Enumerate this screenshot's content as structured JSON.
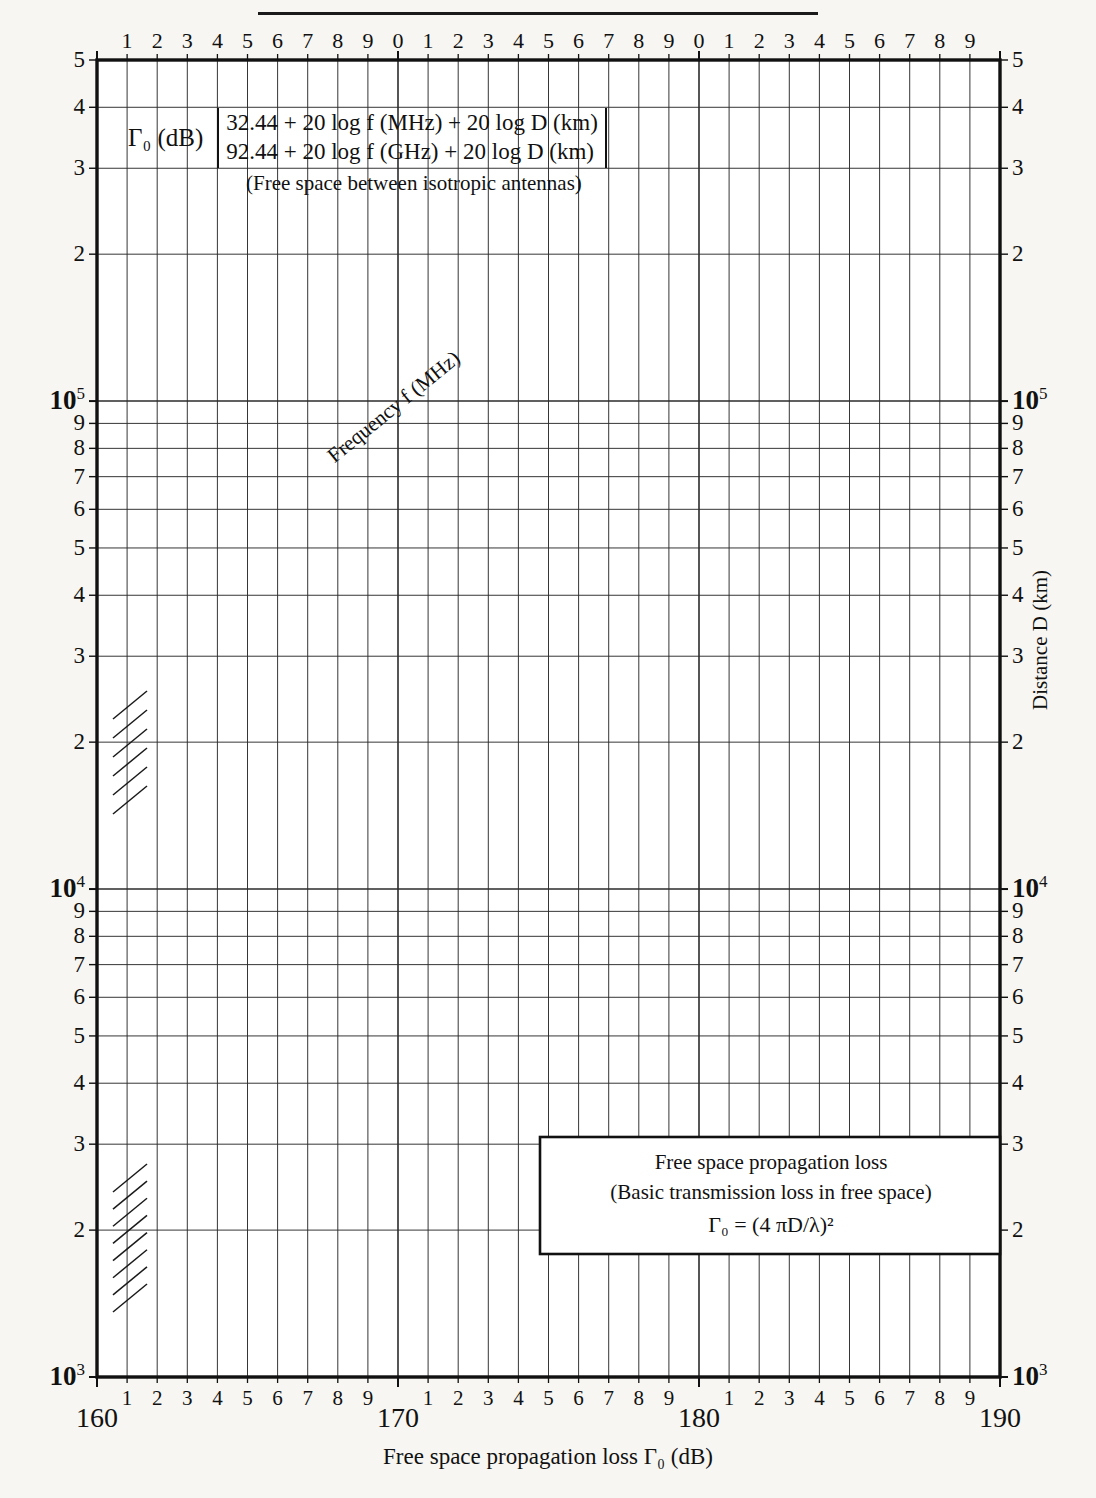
{
  "title_rule": true,
  "formula": {
    "gamma_label": "Γ₀ (dB)",
    "line1": "32.44 + 20 log f (MHz) + 20 log D (km)",
    "line2": "92.44 + 20 log f (GHz) + 20 log D (km)",
    "note": "(Free space between isotropic antennas)"
  },
  "legend": {
    "line1": "Free space propagation loss",
    "line2": "(Basic transmission loss in free space)",
    "line3": "Γ₀ = (4 πD/λ)²"
  },
  "axes": {
    "x_title": "Free space propagation loss Γ₀ (dB)",
    "y_title": "Distance D (km)",
    "x_major_labels": [
      "160",
      "170",
      "180",
      "190"
    ],
    "x_minor_labels": [
      "1",
      "2",
      "3",
      "4",
      "5",
      "6",
      "7",
      "8",
      "9"
    ],
    "x_top_labels": [
      "1",
      "2",
      "3",
      "4",
      "5",
      "6",
      "7",
      "8",
      "9",
      "0",
      "1",
      "2",
      "3",
      "4",
      "5",
      "6",
      "7",
      "8",
      "9",
      "0",
      "1",
      "2",
      "3",
      "4",
      "5",
      "6",
      "7",
      "8",
      "9"
    ],
    "y_labels_left": [
      "5",
      "4",
      "3",
      "2",
      "10⁵",
      "9",
      "8",
      "7",
      "6",
      "5",
      "4",
      "3",
      "2",
      "10⁴",
      "9",
      "8",
      "7",
      "6",
      "5",
      "4",
      "3",
      "2",
      "10³"
    ],
    "y_labels_right": [
      "5",
      "4",
      "3",
      "2",
      "10⁵",
      "9",
      "8",
      "7",
      "6",
      "5",
      "4",
      "3",
      "2",
      "10⁴",
      "9",
      "8",
      "7",
      "6",
      "5",
      "4",
      "3",
      "2",
      "10³"
    ]
  },
  "series_label": "Frequency f (MHz)",
  "chart_data": {
    "type": "line",
    "xlabel": "Free space propagation loss Γ₀ (dB)",
    "ylabel": "Distance D (km)",
    "xlim": [
      160,
      190
    ],
    "ylim": [
      1000,
      500000
    ],
    "xscale": "linear",
    "yscale": "log",
    "grid": true,
    "legend": "in-plot line labels",
    "relation": "Γ₀ = 32.44 + 20 log f(MHz) + 20 log D(km)",
    "x_ticks_major": [
      160,
      170,
      180,
      190
    ],
    "x_ticks_minor_step": 1,
    "y_decades": [
      1000,
      10000,
      100000,
      500000
    ],
    "series": [
      {
        "name": "100",
        "frequency_mhz": 100,
        "bold": true,
        "points": [
          [
            160,
            1.5136
          ],
          [
            190,
            47.863
          ]
        ]
      },
      {
        "name": "200",
        "frequency_mhz": 200,
        "bold": false,
        "points": [
          [
            160,
            0.7568
          ],
          [
            190,
            23.931
          ]
        ]
      },
      {
        "name": "300",
        "frequency_mhz": 300,
        "bold": false,
        "points": [
          [
            160,
            0.5045
          ],
          [
            190,
            15.954
          ]
        ]
      },
      {
        "name": "400",
        "frequency_mhz": 400,
        "bold": false,
        "points": [
          [
            160,
            0.3784
          ],
          [
            190,
            11.966
          ]
        ]
      },
      {
        "name": "500",
        "frequency_mhz": 500,
        "bold": false,
        "points": [
          [
            160,
            0.3027
          ],
          [
            190,
            9.5726
          ]
        ]
      },
      {
        "name": "600",
        "frequency_mhz": 600,
        "bold": false,
        "points": [
          [
            160,
            0.2523
          ],
          [
            190,
            7.9772
          ]
        ]
      },
      {
        "name": "700",
        "frequency_mhz": 700,
        "bold": false,
        "points": [
          [
            160,
            0.2162
          ],
          [
            190,
            6.8376
          ]
        ]
      },
      {
        "name": "800",
        "frequency_mhz": 800,
        "bold": false,
        "points": [
          [
            160,
            0.1892
          ],
          [
            190,
            5.9829
          ]
        ]
      },
      {
        "name": "900",
        "frequency_mhz": 900,
        "bold": false,
        "points": [
          [
            160,
            0.1682
          ],
          [
            190,
            5.3181
          ]
        ]
      },
      {
        "name": "1 000",
        "frequency_mhz": 1000,
        "bold": true,
        "points": [
          [
            160,
            0.1514
          ],
          [
            190,
            4.7863
          ]
        ]
      },
      {
        "name": "1 500",
        "frequency_mhz": 1500,
        "bold": false,
        "points": [
          [
            160,
            0.1009
          ],
          [
            190,
            3.1909
          ]
        ]
      },
      {
        "name": "2 000",
        "frequency_mhz": 2000,
        "bold": false,
        "points": [
          [
            160,
            0.0757
          ],
          [
            190,
            2.3931
          ]
        ]
      },
      {
        "name": "3 000",
        "frequency_mhz": 3000,
        "bold": false,
        "points": [
          [
            160,
            0.0505
          ],
          [
            190,
            1.5954
          ]
        ]
      }
    ],
    "note": "Each line: D(km) = 10^((Γ₀ - 32.44 - 20 log f)/20); plotted distance axis is D in metres × 1000 equivalent, spanning 10³ to 5×10⁵"
  }
}
